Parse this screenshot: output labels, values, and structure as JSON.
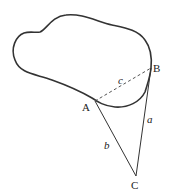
{
  "diagram": {
    "points": {
      "A": "A",
      "B": "B",
      "C": "C"
    },
    "sides": {
      "a": "a",
      "b": "b",
      "c": "c"
    },
    "segments": [
      {
        "name": "c",
        "from": "A",
        "to": "B",
        "style": "dashed"
      },
      {
        "name": "a",
        "from": "B",
        "to": "C",
        "style": "solid"
      },
      {
        "name": "b",
        "from": "A",
        "to": "C",
        "style": "solid"
      }
    ],
    "colors": {
      "stroke": "#333333",
      "background": "#ffffff"
    }
  }
}
